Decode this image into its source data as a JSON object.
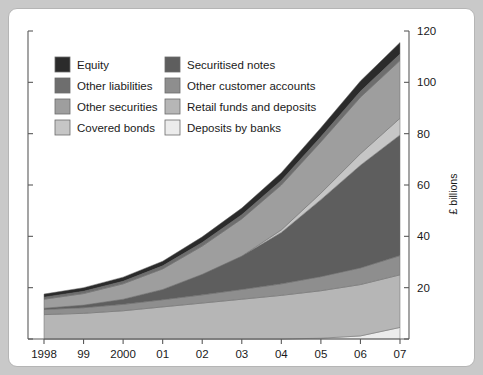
{
  "chart_data": {
    "type": "area",
    "title": "",
    "subtitle": "",
    "xlabel": "",
    "ylabel": "£ billions",
    "stacked": true,
    "grid": false,
    "legend_position": "top-left",
    "xlim": [
      1998,
      2007
    ],
    "ylim": [
      0,
      120
    ],
    "yticks": [
      0,
      20,
      40,
      60,
      80,
      100,
      120
    ],
    "ytick_labels": [
      "",
      "20",
      "40",
      "60",
      "80",
      "100",
      "120"
    ],
    "x": [
      1998,
      1999,
      2000,
      2001,
      2002,
      2003,
      2004,
      2005,
      2006,
      2007
    ],
    "categories": [
      "1998",
      "99",
      "2000",
      "01",
      "02",
      "03",
      "04",
      "05",
      "06",
      "07"
    ],
    "series": [
      {
        "name": "Deposits by banks",
        "color": "#ececec",
        "values": [
          0,
          0,
          0,
          0,
          0,
          0,
          0,
          0.3,
          1.2,
          4.5
        ]
      },
      {
        "name": "Retail funds and deposits",
        "color": "#b6b6b6",
        "values": [
          9.5,
          10.0,
          11.0,
          12.5,
          14.0,
          15.5,
          17.0,
          18.5,
          20.0,
          20.5
        ]
      },
      {
        "name": "Other customer accounts",
        "color": "#8e8e8e",
        "values": [
          2.0,
          2.2,
          2.5,
          2.8,
          3.2,
          3.8,
          4.5,
          5.5,
          6.5,
          7.5
        ]
      },
      {
        "name": "Securitised notes",
        "color": "#5e5e5e",
        "values": [
          0.5,
          1.0,
          2.0,
          4.0,
          8.0,
          13.0,
          20.0,
          30.0,
          40.0,
          47.0
        ]
      },
      {
        "name": "Covered bonds",
        "color": "#c6c6c6",
        "values": [
          0,
          0,
          0,
          0,
          0,
          0,
          1.0,
          2.5,
          4.5,
          6.5
        ]
      },
      {
        "name": "Other securities",
        "color": "#9e9e9e",
        "values": [
          3.5,
          4.5,
          6.0,
          8.0,
          11.0,
          14.5,
          17.5,
          20.0,
          22.0,
          22.5
        ]
      },
      {
        "name": "Other liabilities",
        "color": "#6e6e6e",
        "values": [
          0.8,
          0.9,
          1.0,
          1.2,
          1.4,
          1.6,
          1.8,
          2.0,
          2.3,
          2.5
        ]
      },
      {
        "name": "Equity",
        "color": "#2b2b2b",
        "values": [
          1.2,
          1.4,
          1.6,
          1.8,
          2.2,
          2.6,
          3.0,
          3.5,
          4.0,
          4.5
        ]
      }
    ]
  },
  "legend": {
    "column_left": [
      {
        "label": "Equity",
        "color": "#2b2b2b"
      },
      {
        "label": "Other liabilities",
        "color": "#6e6e6e"
      },
      {
        "label": "Other securities",
        "color": "#9e9e9e"
      },
      {
        "label": "Covered bonds",
        "color": "#c6c6c6"
      }
    ],
    "column_right": [
      {
        "label": "Securitised notes",
        "color": "#5e5e5e"
      },
      {
        "label": "Other customer accounts",
        "color": "#8e8e8e"
      },
      {
        "label": "Retail funds and deposits",
        "color": "#b6b6b6"
      },
      {
        "label": "Deposits by banks",
        "color": "#ececec"
      }
    ]
  },
  "axis": {
    "y_axis_title": "£ billions",
    "y_tick_labels": [
      "20",
      "40",
      "60",
      "80",
      "100",
      "120"
    ],
    "x_tick_labels": [
      "1998",
      "99",
      "2000",
      "01",
      "02",
      "03",
      "04",
      "05",
      "06",
      "07"
    ]
  },
  "style": {
    "page_background": "#c9c9c9",
    "figure_background": "#ffffff",
    "axis_color": "#5a5a5a",
    "text_color": "#1a1a1a",
    "band_outline": "#6b6b6b"
  }
}
